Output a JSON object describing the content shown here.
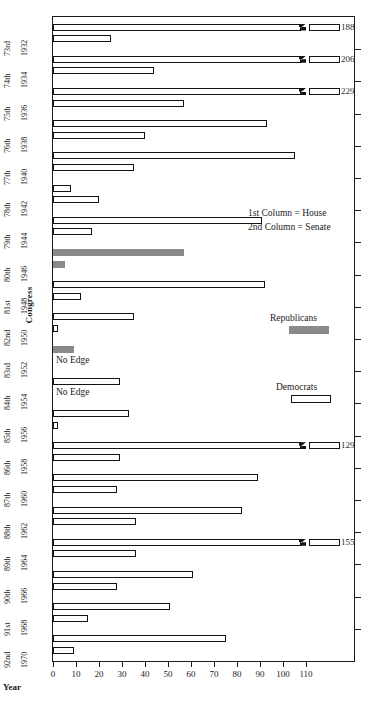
{
  "chart_data": {
    "type": "bar",
    "orientation": "horizontal",
    "title": "",
    "xlabel": "Year",
    "ylabel": "Congress",
    "xlim": [
      0,
      118
    ],
    "xticks": [
      0,
      10,
      20,
      30,
      40,
      50,
      60,
      70,
      80,
      90,
      100,
      110
    ],
    "grid": false,
    "legend_position": "inside-right",
    "notes": [
      "1st Column = House",
      "2nd Column = Senate"
    ],
    "series": [
      {
        "name": "Republicans",
        "color": "#8a8a8a"
      },
      {
        "name": "Democrats",
        "color": "#ffffff"
      }
    ],
    "categories": [
      {
        "congress": "73rd",
        "year": "1932"
      },
      {
        "congress": "74th",
        "year": "1934"
      },
      {
        "congress": "75th",
        "year": "1936"
      },
      {
        "congress": "76th",
        "year": "1938"
      },
      {
        "congress": "77th",
        "year": "1940"
      },
      {
        "congress": "78th",
        "year": "1942"
      },
      {
        "congress": "79th",
        "year": "1944"
      },
      {
        "congress": "80th",
        "year": "1946"
      },
      {
        "congress": "81st",
        "year": "1948"
      },
      {
        "congress": "82nd",
        "year": "1950"
      },
      {
        "congress": "83rd",
        "year": "1952"
      },
      {
        "congress": "84th",
        "year": "1954"
      },
      {
        "congress": "85th",
        "year": "1956"
      },
      {
        "congress": "86th",
        "year": "1958"
      },
      {
        "congress": "87th",
        "year": "1960"
      },
      {
        "congress": "88th",
        "year": "1962"
      },
      {
        "congress": "89th",
        "year": "1964"
      },
      {
        "congress": "90th",
        "year": "1966"
      },
      {
        "congress": "91st",
        "year": "1968"
      },
      {
        "congress": "92nd",
        "year": "1970"
      }
    ],
    "bars": [
      {
        "congress": "73rd",
        "chamber": "House",
        "party": "Democrats",
        "value": 188,
        "broken": true,
        "label": "188"
      },
      {
        "congress": "73rd",
        "chamber": "Senate",
        "party": "Democrats",
        "value": 25,
        "broken": false,
        "label": ""
      },
      {
        "congress": "74th",
        "chamber": "House",
        "party": "Democrats",
        "value": 206,
        "broken": true,
        "label": "206"
      },
      {
        "congress": "74th",
        "chamber": "Senate",
        "party": "Democrats",
        "value": 44,
        "broken": false,
        "label": ""
      },
      {
        "congress": "75th",
        "chamber": "House",
        "party": "Democrats",
        "value": 229,
        "broken": true,
        "label": "229"
      },
      {
        "congress": "75th",
        "chamber": "Senate",
        "party": "Democrats",
        "value": 57,
        "broken": false,
        "label": ""
      },
      {
        "congress": "76th",
        "chamber": "House",
        "party": "Democrats",
        "value": 93,
        "broken": false,
        "label": ""
      },
      {
        "congress": "76th",
        "chamber": "Senate",
        "party": "Democrats",
        "value": 40,
        "broken": false,
        "label": ""
      },
      {
        "congress": "77th",
        "chamber": "House",
        "party": "Democrats",
        "value": 105,
        "broken": false,
        "label": ""
      },
      {
        "congress": "77th",
        "chamber": "Senate",
        "party": "Democrats",
        "value": 35,
        "broken": false,
        "label": ""
      },
      {
        "congress": "78th",
        "chamber": "House",
        "party": "Democrats",
        "value": 8,
        "broken": false,
        "label": ""
      },
      {
        "congress": "78th",
        "chamber": "Senate",
        "party": "Democrats",
        "value": 20,
        "broken": false,
        "label": ""
      },
      {
        "congress": "79th",
        "chamber": "House",
        "party": "Democrats",
        "value": 91,
        "broken": false,
        "label": ""
      },
      {
        "congress": "79th",
        "chamber": "Senate",
        "party": "Democrats",
        "value": 17,
        "broken": false,
        "label": ""
      },
      {
        "congress": "80th",
        "chamber": "House",
        "party": "Republicans",
        "value": 57,
        "broken": false,
        "label": ""
      },
      {
        "congress": "80th",
        "chamber": "Senate",
        "party": "Republicans",
        "value": 5,
        "broken": false,
        "label": ""
      },
      {
        "congress": "81st",
        "chamber": "House",
        "party": "Democrats",
        "value": 92,
        "broken": false,
        "label": ""
      },
      {
        "congress": "81st",
        "chamber": "Senate",
        "party": "Democrats",
        "value": 12,
        "broken": false,
        "label": ""
      },
      {
        "congress": "82nd",
        "chamber": "House",
        "party": "Democrats",
        "value": 35,
        "broken": false,
        "label": ""
      },
      {
        "congress": "82nd",
        "chamber": "Senate",
        "party": "Democrats",
        "value": 2,
        "broken": false,
        "label": ""
      },
      {
        "congress": "83rd",
        "chamber": "House",
        "party": "Republicans",
        "value": 9,
        "broken": false,
        "label": ""
      },
      {
        "congress": "83rd",
        "chamber": "Senate",
        "party": "Republicans",
        "value": 0,
        "broken": false,
        "label": "No Edge"
      },
      {
        "congress": "84th",
        "chamber": "House",
        "party": "Democrats",
        "value": 29,
        "broken": false,
        "label": ""
      },
      {
        "congress": "84th",
        "chamber": "Senate",
        "party": "Democrats",
        "value": 0,
        "broken": false,
        "label": "No Edge"
      },
      {
        "congress": "85th",
        "chamber": "House",
        "party": "Democrats",
        "value": 33,
        "broken": false,
        "label": ""
      },
      {
        "congress": "85th",
        "chamber": "Senate",
        "party": "Democrats",
        "value": 2,
        "broken": false,
        "label": ""
      },
      {
        "congress": "86th",
        "chamber": "House",
        "party": "Democrats",
        "value": 129,
        "broken": true,
        "label": "129"
      },
      {
        "congress": "86th",
        "chamber": "Senate",
        "party": "Democrats",
        "value": 29,
        "broken": false,
        "label": ""
      },
      {
        "congress": "87th",
        "chamber": "House",
        "party": "Democrats",
        "value": 89,
        "broken": false,
        "label": ""
      },
      {
        "congress": "87th",
        "chamber": "Senate",
        "party": "Democrats",
        "value": 28,
        "broken": false,
        "label": ""
      },
      {
        "congress": "88th",
        "chamber": "House",
        "party": "Democrats",
        "value": 82,
        "broken": false,
        "label": ""
      },
      {
        "congress": "88th",
        "chamber": "Senate",
        "party": "Democrats",
        "value": 36,
        "broken": false,
        "label": ""
      },
      {
        "congress": "89th",
        "chamber": "House",
        "party": "Democrats",
        "value": 155,
        "broken": true,
        "label": "155"
      },
      {
        "congress": "89th",
        "chamber": "Senate",
        "party": "Democrats",
        "value": 36,
        "broken": false,
        "label": ""
      },
      {
        "congress": "90th",
        "chamber": "House",
        "party": "Democrats",
        "value": 61,
        "broken": false,
        "label": ""
      },
      {
        "congress": "90th",
        "chamber": "Senate",
        "party": "Democrats",
        "value": 28,
        "broken": false,
        "label": ""
      },
      {
        "congress": "91st",
        "chamber": "House",
        "party": "Democrats",
        "value": 51,
        "broken": false,
        "label": ""
      },
      {
        "congress": "91st",
        "chamber": "Senate",
        "party": "Democrats",
        "value": 15,
        "broken": false,
        "label": ""
      },
      {
        "congress": "92nd",
        "chamber": "House",
        "party": "Democrats",
        "value": 75,
        "broken": false,
        "label": ""
      },
      {
        "congress": "92nd",
        "chamber": "Senate",
        "party": "Democrats",
        "value": 9,
        "broken": false,
        "label": ""
      }
    ]
  },
  "axes": {
    "y_title": "Congress",
    "x_title": "Year",
    "x_tick_labels": [
      "0",
      "10",
      "20",
      "30",
      "40",
      "50",
      "60",
      "70",
      "80",
      "90",
      "100",
      "110"
    ]
  },
  "legend": {
    "column_note_1": "1st Column = House",
    "column_note_2": "2nd Column = Senate",
    "republicans_label": "Republicans",
    "democrats_label": "Democrats",
    "republicans_color": "#8a8a8a",
    "democrats_color": "#ffffff"
  },
  "annotations": {
    "no_edge": "No Edge"
  }
}
